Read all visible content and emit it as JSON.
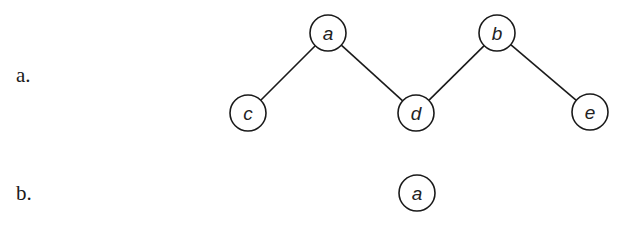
{
  "parts": [
    {
      "label": "a.",
      "graph": {
        "nodes": [
          {
            "id": "a",
            "label": "a",
            "x": 328,
            "y": 33
          },
          {
            "id": "b",
            "label": "b",
            "x": 497,
            "y": 33
          },
          {
            "id": "c",
            "label": "c",
            "x": 248,
            "y": 113
          },
          {
            "id": "d",
            "label": "d",
            "x": 416,
            "y": 113
          },
          {
            "id": "e",
            "label": "e",
            "x": 590,
            "y": 112
          }
        ],
        "edges": [
          {
            "from": "a",
            "to": "c"
          },
          {
            "from": "a",
            "to": "d"
          },
          {
            "from": "b",
            "to": "d"
          },
          {
            "from": "b",
            "to": "e"
          }
        ]
      }
    },
    {
      "label": "b.",
      "graph": {
        "nodes": [
          {
            "id": "a",
            "label": "a",
            "x": 417,
            "y": 193
          }
        ],
        "edges": []
      }
    }
  ],
  "style": {
    "node_radius": 18,
    "stroke_color": "#1a1a1a"
  }
}
